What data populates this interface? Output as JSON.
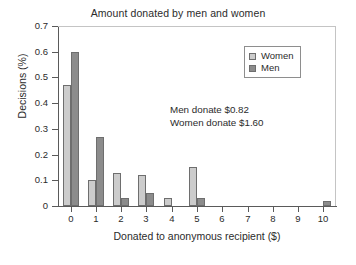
{
  "chart_data": {
    "type": "bar",
    "title": "Amount donated by men and women",
    "xlabel": "Donated to anonymous recipient ($)",
    "ylabel": "Decisions (%)",
    "categories": [
      "0",
      "1",
      "2",
      "3",
      "4",
      "5",
      "6",
      "7",
      "8",
      "9",
      "10"
    ],
    "xlim": [
      -0.5,
      10.5
    ],
    "ylim": [
      0,
      0.7
    ],
    "ytick_labels": [
      "0",
      "0.1",
      "0.2",
      "0.3",
      "0.4",
      "0.5",
      "0.6",
      "0.7"
    ],
    "ytick_values": [
      0,
      0.1,
      0.2,
      0.3,
      0.4,
      0.5,
      0.6,
      0.7
    ],
    "grid": false,
    "legend_position": "upper right",
    "series": [
      {
        "name": "Women",
        "color": "#cccccc",
        "values": [
          0.47,
          0.1,
          0.13,
          0.12,
          0.03,
          0.15,
          0,
          0,
          0,
          0,
          0
        ]
      },
      {
        "name": "Men",
        "color": "#8c8c8c",
        "values": [
          0.6,
          0.27,
          0.03,
          0.05,
          0,
          0.03,
          0,
          0,
          0,
          0,
          0.02
        ]
      }
    ],
    "annotations": [
      "Men donate $0.82",
      "Women donate $1.60"
    ]
  }
}
